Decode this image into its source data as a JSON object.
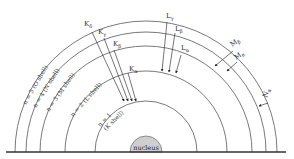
{
  "diagram": {
    "nucleus_label": "nucleus",
    "shells": [
      {
        "n": 1,
        "label": "n = 1",
        "sublabel": "(K shell)",
        "radius": 51
      },
      {
        "n": 2,
        "label": "n = 2 (L shell)",
        "radius": 81
      },
      {
        "n": 3,
        "label": "n = 3 (M shell)",
        "radius": 106
      },
      {
        "n": 4,
        "label": "n = 4 (N shell)",
        "radius": 120
      },
      {
        "n": 5,
        "label": "n = 5 (O shell)",
        "radius": 131
      }
    ],
    "transitions": {
      "K_delta": {
        "main": "K",
        "sub": "δ"
      },
      "K_gamma": {
        "main": "K",
        "sub": "γ"
      },
      "K_beta": {
        "main": "K",
        "sub": "β"
      },
      "K_alpha": {
        "main": "K",
        "sub": "α"
      },
      "L_gamma": {
        "main": "L",
        "sub": "γ"
      },
      "L_beta": {
        "main": "L",
        "sub": "β"
      },
      "L_alpha": {
        "main": "L",
        "sub": "α"
      },
      "M_beta": {
        "main": "M",
        "sub": "β"
      },
      "M_alpha": {
        "main": "M",
        "sub": "α"
      },
      "N_alpha": {
        "main": "N",
        "sub": "α"
      }
    }
  }
}
